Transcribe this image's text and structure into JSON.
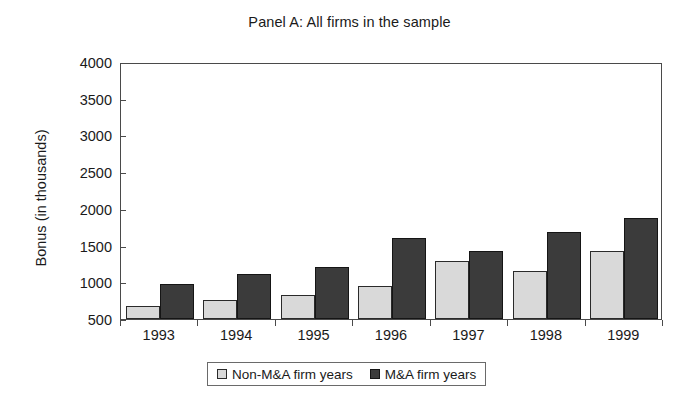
{
  "chart_data": {
    "type": "bar",
    "title": "Panel A: All firms in the sample",
    "xlabel": "",
    "ylabel": "Bonus (in thousands)",
    "categories": [
      "1993",
      "1994",
      "1995",
      "1996",
      "1997",
      "1998",
      "1999"
    ],
    "series": [
      {
        "name": "Non-M&A firm years",
        "color": "#d9d9d9",
        "values": [
          680,
          760,
          830,
          950,
          1290,
          1150,
          1420
        ]
      },
      {
        "name": "M&A firm years",
        "color": "#3b3b3b",
        "values": [
          980,
          1110,
          1210,
          1610,
          1420,
          1690,
          1870
        ]
      }
    ],
    "ylim": [
      500,
      4000
    ],
    "ytick_step": 500,
    "yticks": [
      4000,
      3500,
      3000,
      2500,
      2000,
      1500,
      1000,
      500
    ],
    "ytick_labels": [
      "4000",
      "3500",
      "3000",
      "2500",
      "2000",
      "1500",
      "1000",
      "500"
    ],
    "grid": false,
    "legend_position": "bottom-center"
  },
  "legend": {
    "entries": [
      {
        "label": "Non-M&A firm years",
        "swatch": "light"
      },
      {
        "label": "M&A firm years",
        "swatch": "dark"
      }
    ]
  }
}
